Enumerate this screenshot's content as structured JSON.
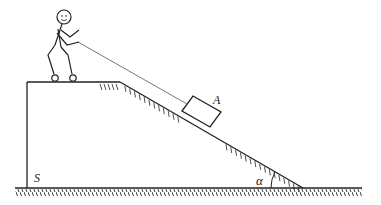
{
  "diagram": {
    "type": "physics-incline",
    "labels": {
      "block": "A",
      "platform": "S",
      "angle": "α"
    },
    "colors": {
      "stroke": "#222222",
      "rope": "#777777",
      "background": "#ffffff"
    },
    "elements": [
      {
        "name": "platform",
        "label": "S"
      },
      {
        "name": "incline",
        "angle_label": "α"
      },
      {
        "name": "block",
        "label": "A"
      },
      {
        "name": "rope"
      },
      {
        "name": "person"
      },
      {
        "name": "ground"
      }
    ]
  }
}
